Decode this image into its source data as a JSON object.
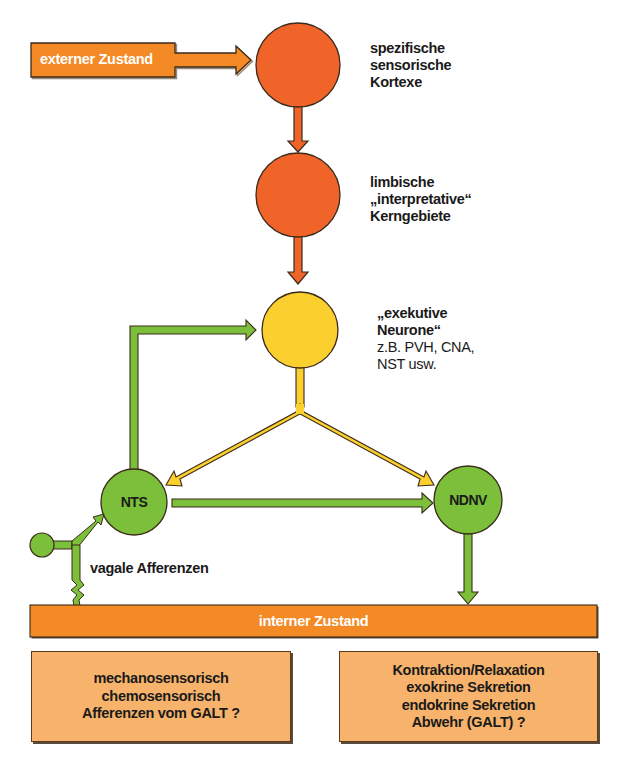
{
  "colors": {
    "red_node": "#f0642a",
    "yellow_node": "#fbcf2e",
    "green_node": "#7bbf3a",
    "orange_bar": "#f38a25",
    "box_fill": "#f7b36b",
    "outline": "#3a2a1a",
    "text": "#1a1a1a",
    "bar_text": "#ffffff"
  },
  "external_state": {
    "label": "externer Zustand"
  },
  "nodes": {
    "sensory_cortex": {
      "lines": [
        "spezifische",
        "sensorische",
        "Kortexe"
      ]
    },
    "limbic_nuclei": {
      "lines": [
        "limbische",
        "„interpretative“",
        "Kerngebiete"
      ]
    },
    "executive_neurons": {
      "lines": [
        "„exekutive",
        "Neurone“"
      ],
      "detail_lines": [
        "z.B. PVH, CNA,",
        "NST usw."
      ]
    },
    "nts": {
      "label": "NTS"
    },
    "ndnv": {
      "label": "NDNV"
    }
  },
  "vagal_afferents": {
    "label": "vagale Afferenzen"
  },
  "internal_state": {
    "label": "interner Zustand"
  },
  "input_box": {
    "lines": [
      "mechanosensorisch",
      "chemosensorisch",
      "Afferenzen vom GALT ?"
    ]
  },
  "output_box": {
    "lines": [
      "Kontraktion/Relaxation",
      "exokrine Sekretion",
      "endokrine Sekretion",
      "Abwehr (GALT) ?"
    ]
  }
}
